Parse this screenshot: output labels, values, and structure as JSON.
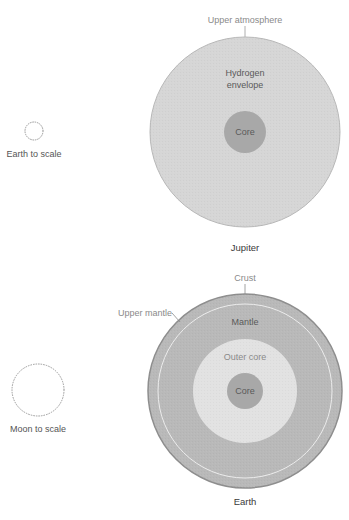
{
  "colors": {
    "background": "#ffffff",
    "jupiter_envelope": "#d6d6d6",
    "jupiter_outline": "#b8b8b8",
    "core": "#a8a8a8",
    "earth_crust": "#8e8e8e",
    "earth_mantle": "#b9b9b9",
    "earth_outer_core": "#e2e2e2",
    "dotted_scale": "#9a9a9a",
    "label": "#555555",
    "label_light": "#8a8a8a"
  },
  "jupiter": {
    "title": "Jupiter",
    "labels": {
      "upper_atmosphere": "Upper atmosphere",
      "envelope_line1": "Hydrogen",
      "envelope_line2": "envelope",
      "core": "Core"
    },
    "scale_reference": "Earth to scale"
  },
  "earth": {
    "title": "Earth",
    "labels": {
      "crust": "Crust",
      "upper_mantle": "Upper mantle",
      "mantle": "Mantle",
      "outer_core": "Outer core",
      "core": "Core"
    },
    "scale_reference": "Moon to scale"
  }
}
